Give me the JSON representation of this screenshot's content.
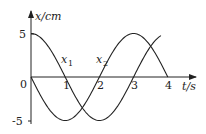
{
  "chart_data": {
    "type": "line",
    "title": "",
    "xlabel": "t/s",
    "ylabel": "x/cm",
    "x_ticks": [
      "1",
      "2",
      "3",
      "4"
    ],
    "y_ticks": [
      "5",
      "-5"
    ],
    "origin_label": "0",
    "xlim": [
      0,
      4.2
    ],
    "ylim": [
      -5,
      5
    ],
    "grid": false,
    "series": [
      {
        "name": "x1",
        "formula": "5cos(πt/2)",
        "x": [
          0,
          1,
          2,
          3,
          3.8
        ],
        "values": [
          5,
          0,
          -5,
          0,
          4.9
        ]
      },
      {
        "name": "x2",
        "formula": "-5sin(πt/2)",
        "x": [
          0,
          1,
          2,
          3,
          4
        ],
        "values": [
          0,
          -5,
          0,
          5,
          0
        ]
      }
    ],
    "series_labels": {
      "x1": "x",
      "x1_sub": "1",
      "x2": "x",
      "x2_sub": "2"
    }
  }
}
